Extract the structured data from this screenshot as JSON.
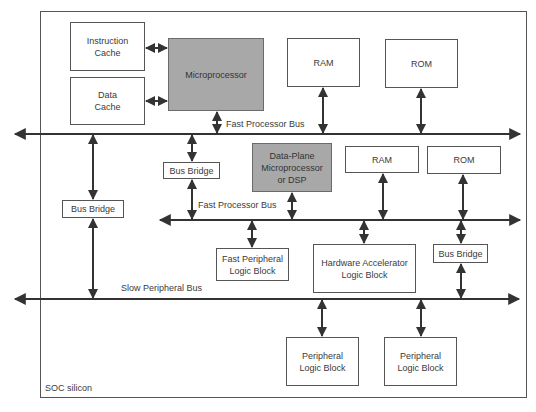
{
  "colors": {
    "line": "#333333",
    "border": "#555555",
    "shaded_fill": "#a8a8a8",
    "background": "#ffffff"
  },
  "container": {
    "label": "SOC silicon"
  },
  "buses": {
    "main": {
      "label": "Fast Processor Bus"
    },
    "secondary": {
      "label": "Fast Processor Bus"
    },
    "slow": {
      "label": "Slow Peripheral Bus"
    }
  },
  "blocks": {
    "instruction_cache": "Instruction\nCache",
    "data_cache": "Data\nCache",
    "microprocessor": "Microprocessor",
    "ram_top": "RAM",
    "rom_top": "ROM",
    "bus_bridge_mid": "Bus Bridge",
    "dsp": "Data-Plane\nMicroprocessor\nor DSP",
    "ram_mid": "RAM",
    "rom_mid": "ROM",
    "bus_bridge_left": "Bus Bridge",
    "fast_peripheral": "Fast Peripheral\nLogic Block",
    "hw_accelerator": "Hardware Accelerator\nLogic Block",
    "bus_bridge_right": "Bus Bridge",
    "peripheral_1": "Peripheral\nLogic Block",
    "peripheral_2": "Peripheral\nLogic Block"
  }
}
